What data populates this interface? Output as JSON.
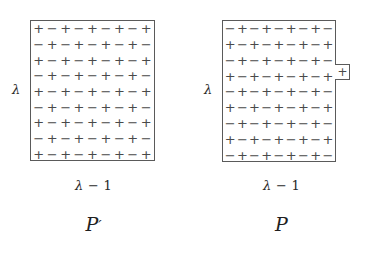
{
  "figure": {
    "background_color": "#ffffff",
    "line_color": "#5a5a5a",
    "sign_color": "#4a4a4a",
    "text_color": "#2b2b2b",
    "symbols": {
      "plus": "+",
      "minus": "−",
      "lambda": "λ"
    }
  },
  "panels": [
    {
      "id": "panel-p-prime",
      "name": "P-prime",
      "side_label": "λ",
      "bottom_label_lambda": "λ",
      "bottom_label_rest": " − 1",
      "bottom_label_full": "λ − 1",
      "poly_label": "𝒫′",
      "poly_letter": "P",
      "poly_prime": "′",
      "has_protrusion": false,
      "grid": {
        "rows": 9,
        "cols": 9,
        "width_px": 125,
        "height_px": 141,
        "sign_rows": [
          [
            "+",
            "−",
            "+",
            "−",
            "+",
            "−",
            "+",
            "−",
            "+"
          ],
          [
            "−",
            "+",
            "−",
            "+",
            "−",
            "+",
            "−",
            "+",
            "−"
          ],
          [
            "+",
            "−",
            "+",
            "−",
            "+",
            "−",
            "+",
            "−",
            "+"
          ],
          [
            "−",
            "+",
            "−",
            "+",
            "−",
            "+",
            "−",
            "+",
            "−"
          ],
          [
            "+",
            "−",
            "+",
            "−",
            "+",
            "−",
            "+",
            "−",
            "+"
          ],
          [
            "−",
            "+",
            "−",
            "+",
            "−",
            "+",
            "−",
            "+",
            "−"
          ],
          [
            "+",
            "−",
            "+",
            "−",
            "+",
            "−",
            "+",
            "−",
            "+"
          ],
          [
            "−",
            "+",
            "−",
            "+",
            "−",
            "+",
            "−",
            "+",
            "−"
          ],
          [
            "+",
            "−",
            "+",
            "−",
            "+",
            "−",
            "+",
            "−",
            "+"
          ]
        ]
      }
    },
    {
      "id": "panel-p",
      "name": "P",
      "side_label": "λ",
      "bottom_label_lambda": "λ",
      "bottom_label_rest": " − 1",
      "bottom_label_full": "λ − 1",
      "poly_label": "𝒫",
      "poly_letter": "P",
      "poly_prime": "",
      "has_protrusion": true,
      "protrusion": {
        "sign": "+",
        "row_index": 3,
        "width_px": 14,
        "height_px": 16,
        "offset_top_px": 44
      },
      "grid": {
        "rows": 9,
        "cols": 9,
        "width_px": 114,
        "height_px": 142,
        "sign_rows": [
          [
            "−",
            "+",
            "−",
            "+",
            "−",
            "+",
            "−",
            "+",
            "−"
          ],
          [
            "+",
            "−",
            "+",
            "−",
            "+",
            "−",
            "+",
            "−",
            "+"
          ],
          [
            "−",
            "+",
            "−",
            "+",
            "−",
            "+",
            "−",
            "+",
            "−"
          ],
          [
            "+",
            "−",
            "+",
            "−",
            "+",
            "−",
            "+",
            "−",
            "+"
          ],
          [
            "−",
            "+",
            "−",
            "+",
            "−",
            "+",
            "−",
            "+",
            "−"
          ],
          [
            "+",
            "−",
            "+",
            "−",
            "+",
            "−",
            "+",
            "−",
            "+"
          ],
          [
            "−",
            "+",
            "−",
            "+",
            "−",
            "+",
            "−",
            "+",
            "−"
          ],
          [
            "+",
            "−",
            "+",
            "−",
            "+",
            "−",
            "+",
            "−",
            "+"
          ],
          [
            "−",
            "+",
            "−",
            "+",
            "−",
            "+",
            "−",
            "+",
            "−"
          ]
        ]
      }
    }
  ]
}
